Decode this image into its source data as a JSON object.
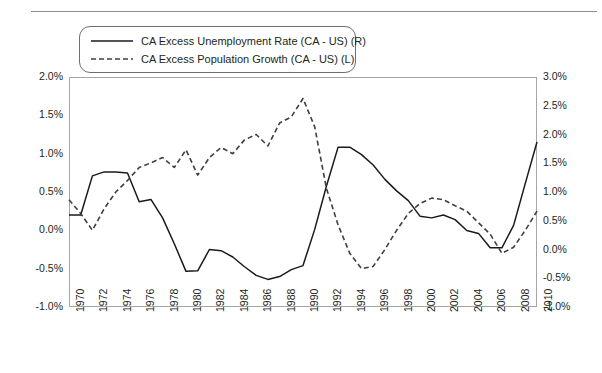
{
  "chart_data": {
    "type": "line",
    "title": "",
    "xlabel": "",
    "ylabel_left": "",
    "ylabel_right": "",
    "grid": false,
    "legend_position": "top-left",
    "xlim": [
      1970,
      2010
    ],
    "xticks": [
      1970,
      1972,
      1974,
      1976,
      1978,
      1980,
      1982,
      1984,
      1986,
      1988,
      1990,
      1992,
      1994,
      1996,
      1998,
      2000,
      2002,
      2004,
      2006,
      2008,
      2010
    ],
    "xtick_labels": [
      "1970",
      "1972",
      "1974",
      "1976",
      "1978",
      "1980",
      "1982",
      "1984",
      "1986",
      "1988",
      "1990",
      "1992",
      "1994",
      "1996",
      "1998",
      "2000",
      "2002",
      "2004",
      "2006",
      "2008",
      "2010"
    ],
    "left_axis": {
      "ylim": [
        -1.0,
        2.0
      ],
      "ticks": [
        2.0,
        1.5,
        1.0,
        0.5,
        0.0,
        -0.5,
        -1.0
      ],
      "tick_labels": [
        "2.0%",
        "1.5%",
        "1.0%",
        "0.5%",
        "0.0%",
        "-0.5%",
        "-1.0%"
      ]
    },
    "right_axis": {
      "ylim": [
        -1.0,
        3.0
      ],
      "ticks": [
        3.0,
        2.5,
        2.0,
        1.5,
        1.0,
        0.5,
        0.0,
        -0.5,
        -1.0
      ],
      "tick_labels": [
        "3.0%",
        "2.5%",
        "2.0%",
        "1.5%",
        "1.0%",
        "0.5%",
        "0.0%",
        "-0.5%",
        "-1.0%"
      ]
    },
    "x": [
      1970,
      1971,
      1972,
      1973,
      1974,
      1975,
      1976,
      1977,
      1978,
      1979,
      1980,
      1981,
      1982,
      1983,
      1984,
      1985,
      1986,
      1987,
      1988,
      1989,
      1990,
      1991,
      1992,
      1993,
      1994,
      1995,
      1996,
      1997,
      1998,
      1999,
      2000,
      2001,
      2002,
      2003,
      2004,
      2005,
      2006,
      2007,
      2008,
      2009,
      2010
    ],
    "series": [
      {
        "name": "CA Excess Unemployment Rate (CA - US) (R)",
        "axis": "right",
        "style": "solid",
        "color": "#1a1a1a",
        "values": [
          0.6,
          0.6,
          1.28,
          1.35,
          1.35,
          1.33,
          0.83,
          0.87,
          0.55,
          0.1,
          -0.38,
          -0.37,
          0.0,
          -0.02,
          -0.13,
          -0.3,
          -0.45,
          -0.52,
          -0.47,
          -0.35,
          -0.28,
          0.35,
          1.1,
          1.78,
          1.78,
          1.65,
          1.47,
          1.22,
          1.02,
          0.85,
          0.58,
          0.55,
          0.6,
          0.52,
          0.33,
          0.28,
          0.03,
          0.03,
          0.42,
          1.15,
          1.87
        ]
      },
      {
        "name": "CA Excess Population Growth (CA - US) (L)",
        "axis": "left",
        "style": "dashed",
        "color": "#3f3f3f",
        "values": [
          0.4,
          0.22,
          0.0,
          0.28,
          0.5,
          0.65,
          0.82,
          0.88,
          0.95,
          0.82,
          1.05,
          0.72,
          0.95,
          1.08,
          1.0,
          1.18,
          1.25,
          1.1,
          1.4,
          1.48,
          1.72,
          1.35,
          0.55,
          0.07,
          -0.3,
          -0.5,
          -0.47,
          -0.25,
          0.0,
          0.22,
          0.35,
          0.42,
          0.4,
          0.32,
          0.25,
          0.1,
          -0.05,
          -0.3,
          -0.22,
          0.0,
          0.25
        ]
      }
    ]
  },
  "legend": {
    "entries": [
      {
        "label": "CA Excess Unemployment Rate (CA - US) (R)",
        "style": "solid"
      },
      {
        "label": "CA Excess Population Growth (CA - US) (L)",
        "style": "dashed"
      }
    ]
  }
}
